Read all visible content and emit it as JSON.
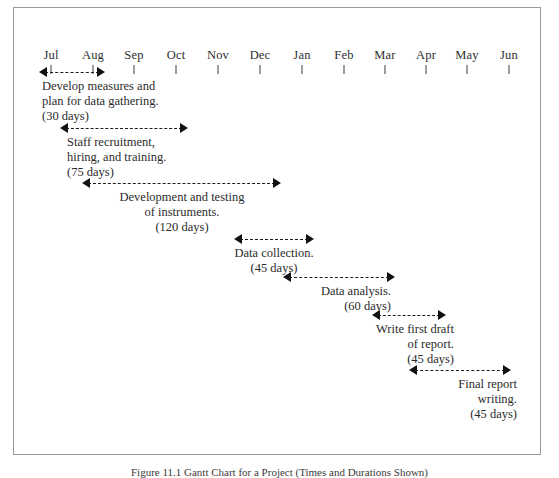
{
  "figure": {
    "type": "gantt-chart",
    "caption": "Figure 11.1  Gantt Chart for a Project (Times and Durations Shown)",
    "border_color": "#9a9a9a",
    "text_color": "#2b2b2b",
    "arrow_color": "#111111",
    "background": "#ffffff"
  },
  "timeline": {
    "label": "Months",
    "months": [
      "Jul",
      "Aug",
      "Sep",
      "Oct",
      "Nov",
      "Dec",
      "Jan",
      "Feb",
      "Mar",
      "Apr",
      "May",
      "Jun"
    ],
    "tick_x": [
      50,
      92,
      133,
      175,
      217,
      259,
      301,
      343,
      384,
      425,
      466,
      508
    ]
  },
  "chart_data": {
    "type": "bar",
    "orientation": "horizontal",
    "title": "Figure 11.1  Gantt Chart for a Project (Times and Durations Shown)",
    "xlabel": "",
    "ylabel": "",
    "categories": [
      "Develop measures and plan for data gathering.",
      "Staff recruitment, hiring, and training.",
      "Development and testing of instruments.",
      "Data collection.",
      "Data analysis.",
      "Write first draft of report.",
      "Final report writing."
    ],
    "values": [
      30,
      75,
      120,
      45,
      60,
      45,
      45
    ],
    "value_unit": "days",
    "x_tick_labels": [
      "Jul",
      "Aug",
      "Sep",
      "Oct",
      "Nov",
      "Dec",
      "Jan",
      "Feb",
      "Mar",
      "Apr",
      "May",
      "Jun"
    ],
    "grid": false,
    "legend": false
  },
  "tasks": [
    {
      "id": "task-1",
      "lines": [
        "Develop measures and",
        "plan for data gathering."
      ],
      "duration": "(30 days)",
      "duration_days": 30,
      "align": "left",
      "bar": {
        "x": 38,
        "y": 66,
        "width": 66
      },
      "caption": {
        "x": 41,
        "y": 78
      }
    },
    {
      "id": "task-2",
      "lines": [
        "Staff recruitment,",
        "hiring, and training."
      ],
      "duration": "(75 days)",
      "duration_days": 75,
      "align": "left",
      "bar": {
        "x": 59,
        "y": 122,
        "width": 128
      },
      "caption": {
        "x": 66,
        "y": 134
      }
    },
    {
      "id": "task-3",
      "lines": [
        "Development and testing",
        "of instruments."
      ],
      "duration": "(120 days)",
      "duration_days": 120,
      "align": "center",
      "bar": {
        "x": 81,
        "y": 177,
        "width": 199
      },
      "caption": {
        "x": 181,
        "y": 189
      }
    },
    {
      "id": "task-4",
      "lines": [
        "Data collection."
      ],
      "duration": "(45 days)",
      "duration_days": 45,
      "align": "center",
      "bar": {
        "x": 233,
        "y": 233,
        "width": 80
      },
      "caption": {
        "x": 273,
        "y": 245
      }
    },
    {
      "id": "task-5",
      "lines": [
        "Data analysis."
      ],
      "duration": "(60 days)",
      "duration_days": 60,
      "align": "right",
      "bar": {
        "x": 282,
        "y": 271,
        "width": 112
      },
      "caption": {
        "x": 392,
        "y": 283
      }
    },
    {
      "id": "task-6",
      "lines": [
        "Write first draft",
        "of report."
      ],
      "duration": "(45 days)",
      "duration_days": 45,
      "align": "right",
      "bar": {
        "x": 371,
        "y": 309,
        "width": 74
      },
      "caption": {
        "x": 455,
        "y": 321
      }
    },
    {
      "id": "task-7",
      "lines": [
        "Final report",
        "writing."
      ],
      "duration": "(45 days)",
      "duration_days": 45,
      "align": "right",
      "bar": {
        "x": 408,
        "y": 364,
        "width": 102
      },
      "caption": {
        "x": 518,
        "y": 376
      }
    }
  ]
}
